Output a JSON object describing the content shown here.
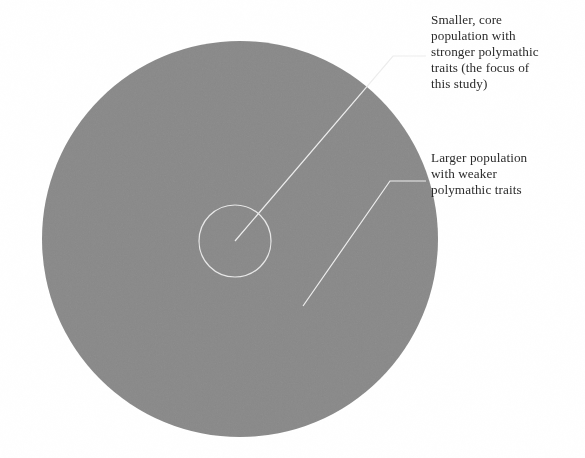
{
  "figure": {
    "canvas": {
      "width": 585,
      "height": 458,
      "background": "#ffffff"
    },
    "outer_circle": {
      "label": "outer-population-circle",
      "center_x": 240,
      "center_y": 239,
      "radius": 198,
      "fill": "#8a8a8a",
      "stroke": "none"
    },
    "inner_circle": {
      "label": "core-population-circle",
      "center_x": 235,
      "center_y": 241,
      "radius": 36,
      "fill": "none",
      "stroke": "#e8e8e8",
      "stroke_width": 1.2
    },
    "leader_lines": [
      {
        "label": "core-leader-line",
        "points": "235,241 393,56 426,56",
        "stroke": "#ededed",
        "stroke_width": 1.2
      },
      {
        "label": "outer-leader-line",
        "points": "303,306 390,181 426,181",
        "stroke": "#ededed",
        "stroke_width": 1.2
      }
    ]
  },
  "callouts": {
    "core": "Smaller, core\npopulation with\nstronger polymathic\ntraits (the focus of\nthis study)",
    "outer": "Larger population\nwith weaker\npolymathic traits"
  }
}
